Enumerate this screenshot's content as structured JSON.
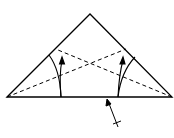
{
  "diagram": {
    "type": "origami-fold-instruction",
    "shape": "triangle",
    "colors": {
      "stroke": "#000000",
      "background": "#ffffff"
    },
    "elements": [
      {
        "name": "triangle-outline",
        "kind": "solid-line"
      },
      {
        "name": "valley-fold-left",
        "kind": "dashed-line"
      },
      {
        "name": "valley-fold-right",
        "kind": "dashed-line"
      },
      {
        "name": "fold-up-arrow-left",
        "kind": "curved-arrow"
      },
      {
        "name": "fold-up-arrow-right",
        "kind": "curved-arrow"
      },
      {
        "name": "flip-reference-arrow",
        "kind": "arrow"
      }
    ]
  }
}
